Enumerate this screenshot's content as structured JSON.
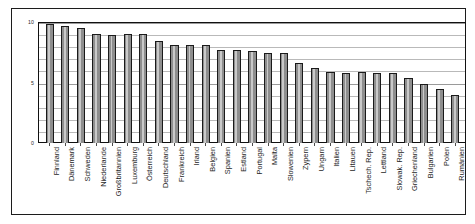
{
  "chart_data": {
    "type": "bar",
    "title": "",
    "subtitle": "",
    "xlabel": "",
    "ylabel": "",
    "ylim": [
      0,
      10
    ],
    "yticks": [
      0,
      5,
      10
    ],
    "ytick_labels": [
      "0",
      "5",
      "10"
    ],
    "grid": true,
    "legend": null,
    "orientation": "vertical",
    "bar_color": "#8e8e8e",
    "bar_edge_color": "#1a1a1a",
    "categories": [
      "Finnland",
      "Dänemark",
      "Schweden",
      "Niederlande",
      "Großbritannien",
      "Luxemburg",
      "Österreich",
      "Deutschland",
      "Frankreich",
      "Irland",
      "Belgien",
      "Spanien",
      "Estland",
      "Portugal",
      "Malta",
      "Slowenien",
      "Zypern",
      "Ungarn",
      "Italien",
      "Litauen",
      "Tschech. Rep.",
      "Lettland",
      "Slowak. Rep.",
      "Griechenland",
      "Bulgarien",
      "Polen",
      "Rumänien"
    ],
    "values": [
      9.8,
      9.7,
      9.5,
      9.0,
      8.9,
      9.0,
      9.0,
      8.4,
      8.1,
      8.1,
      8.1,
      7.7,
      7.7,
      7.6,
      7.4,
      7.4,
      6.6,
      6.2,
      5.9,
      5.8,
      5.9,
      5.8,
      5.8,
      5.4,
      4.9,
      4.5,
      4.0
    ]
  },
  "axis": {
    "y_top_label": "10",
    "y_mid_label": "5",
    "y_zero_label": "0"
  }
}
